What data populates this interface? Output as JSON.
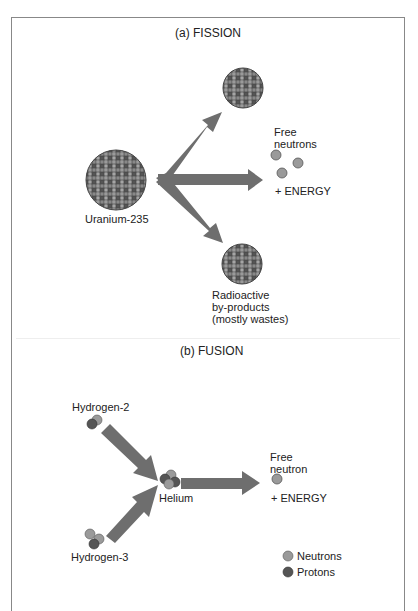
{
  "fission": {
    "title": "(a) FISSION",
    "source_label": "Uranium-235",
    "free_neutrons_line1": "Free",
    "free_neutrons_line2": "neutrons",
    "energy": "+ ENERGY",
    "byproducts_line1": "Radioactive",
    "byproducts_line2": "by-products",
    "byproducts_line3": "(mostly wastes)"
  },
  "fusion": {
    "title": "(b) FUSION",
    "input1": "Hydrogen-2",
    "input2": "Hydrogen-3",
    "product": "Helium",
    "free_neutron_line1": "Free",
    "free_neutron_line2": "neutron",
    "energy": "+ ENERGY"
  },
  "legend": {
    "items": [
      {
        "label": "Neutrons",
        "color": "#9a9a9a"
      },
      {
        "label": "Protons",
        "color": "#555555"
      }
    ]
  },
  "colors": {
    "arrow": "#6e6e6e",
    "neutron": "#9a9a9a",
    "proton": "#555555"
  }
}
